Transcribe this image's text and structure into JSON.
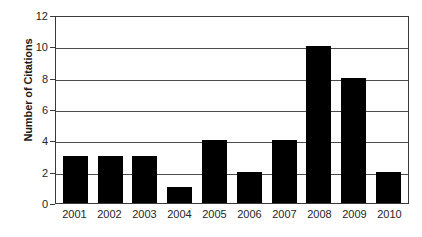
{
  "chart_data": {
    "type": "bar",
    "title": "",
    "subtitle": "",
    "xlabel": "",
    "ylabel": "Number of Citations",
    "categories": [
      "2001",
      "2002",
      "2003",
      "2004",
      "2005",
      "2006",
      "2007",
      "2008",
      "2009",
      "2010"
    ],
    "values": [
      3,
      3,
      3,
      1,
      4,
      2,
      4,
      10,
      8,
      2
    ],
    "series": [
      {
        "name": "Number of Citations",
        "values": [
          3,
          3,
          3,
          1,
          4,
          2,
          4,
          10,
          8,
          2
        ]
      }
    ],
    "ylim": [
      0,
      12
    ],
    "y_ticks": [
      0,
      2,
      4,
      6,
      8,
      10,
      12
    ],
    "y_tick_labels": [
      "0",
      "2",
      "4",
      "6",
      "8",
      "10",
      "12"
    ],
    "grid": true,
    "grid_axis": "y",
    "legend": false,
    "legend_position": "none",
    "annotations": [],
    "colors": {
      "bar": "#000000",
      "gridline": "#4d4d4d",
      "axis": "#3a3a3a",
      "text": "#262626",
      "background": "#ffffff"
    }
  }
}
